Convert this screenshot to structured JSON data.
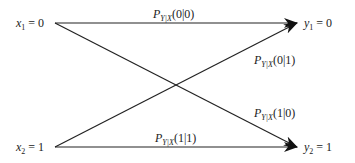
{
  "diagram": {
    "type": "binary-channel",
    "inputs": [
      {
        "sym": "x",
        "sub": "1",
        "value": "0"
      },
      {
        "sym": "x",
        "sub": "2",
        "value": "1"
      }
    ],
    "outputs": [
      {
        "sym": "y",
        "sub": "1",
        "value": "0"
      },
      {
        "sym": "y",
        "sub": "2",
        "value": "1"
      }
    ],
    "edges": [
      {
        "from": "x1",
        "to": "y1",
        "prob": "P",
        "sub": "Y|X",
        "arg": "(0|0)"
      },
      {
        "from": "x2",
        "to": "y1",
        "prob": "P",
        "sub": "Y|X",
        "arg": "(0|1)"
      },
      {
        "from": "x1",
        "to": "y2",
        "prob": "P",
        "sub": "Y|X",
        "arg": "(1|0)"
      },
      {
        "from": "x2",
        "to": "y2",
        "prob": "P",
        "sub": "Y|X",
        "arg": "(1|1)"
      }
    ],
    "eq": "="
  }
}
